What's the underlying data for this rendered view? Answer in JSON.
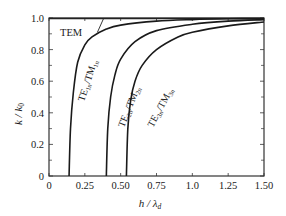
{
  "chart_data": {
    "type": "line",
    "title": "",
    "xlabel": "h / λd",
    "ylabel": "k / k0",
    "xlim": [
      0,
      1.5
    ],
    "ylim": [
      0,
      1.0
    ],
    "grid": false,
    "legend": "inline curve labels",
    "x_ticks": [
      "0",
      "0.25",
      "0.50",
      "0.75",
      "1.0",
      "1.25",
      "1.50"
    ],
    "y_ticks": [
      "0",
      "0.2",
      "0.4",
      "0.6",
      "0.8",
      "1.0"
    ],
    "series": [
      {
        "name": "TEM",
        "label_html": "TEM",
        "cutoff": 0,
        "x": [
          0,
          1.5
        ],
        "y": [
          1.0,
          1.0
        ]
      },
      {
        "name": "TE1n/TM1n",
        "cutoff": 0.14,
        "x": [
          0.14,
          0.15,
          0.17,
          0.2,
          0.25,
          0.3,
          0.4,
          0.5,
          0.75,
          1.0,
          1.25,
          1.5
        ],
        "y": [
          0.0,
          0.3,
          0.53,
          0.72,
          0.83,
          0.88,
          0.93,
          0.955,
          0.98,
          0.99,
          0.995,
          0.997
        ]
      },
      {
        "name": "TE2n/TM2n",
        "cutoff": 0.4,
        "x": [
          0.4,
          0.41,
          0.43,
          0.46,
          0.5,
          0.6,
          0.75,
          1.0,
          1.25,
          1.5
        ],
        "y": [
          0.0,
          0.3,
          0.5,
          0.64,
          0.74,
          0.85,
          0.92,
          0.96,
          0.98,
          0.99
        ]
      },
      {
        "name": "TE3n/TM3n",
        "cutoff": 0.54,
        "x": [
          0.54,
          0.55,
          0.57,
          0.6,
          0.65,
          0.75,
          0.9,
          1.0,
          1.25,
          1.5
        ],
        "y": [
          0.0,
          0.3,
          0.48,
          0.6,
          0.7,
          0.8,
          0.88,
          0.91,
          0.95,
          0.975
        ]
      }
    ]
  },
  "labels": {
    "tem": "TEM",
    "te1_main": "TE",
    "te1_sub": "1n",
    "tm1_main": "/TM",
    "tm1_sub": "1n",
    "te2_main": "TE",
    "te2_sub": "2n",
    "tm2_main": "/TM",
    "tm2_sub": "2n",
    "te3_main": "TE",
    "te3_sub": "3n",
    "tm3_main": "/TM",
    "tm3_sub": "3n",
    "ylabel_main": "k / k",
    "ylabel_sub": "0",
    "xlabel_main": "h / λ",
    "xlabel_sub": "d"
  }
}
